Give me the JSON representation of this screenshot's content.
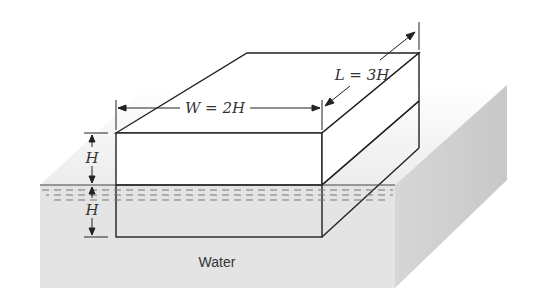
{
  "figure": {
    "labels": {
      "length": "L = 3H",
      "width": "W = 2H",
      "height_above": "H",
      "height_below": "H",
      "fluid": "Water"
    },
    "colors": {
      "line": "#222222",
      "water_front": "#e4e4e4",
      "water_side": "#cfcfcf",
      "water_top": "#f0f0f0",
      "block_face": "#ffffff",
      "ripple": "#777777"
    }
  }
}
